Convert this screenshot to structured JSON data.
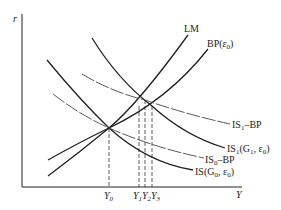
{
  "diagram": {
    "type": "IS-LM-BP macroeconomic diagram",
    "axes": {
      "y_label": "r",
      "x_label": "Y"
    },
    "curves": [
      {
        "id": "lm",
        "label": "LM",
        "style": "solid"
      },
      {
        "id": "bp",
        "label": "BP(ε0)",
        "label_main": "BP(",
        "label_sym": "ε",
        "label_sub": "0",
        "label_close": ")",
        "style": "solid"
      },
      {
        "id": "is1-bp",
        "label": "IS1–BP",
        "label_main": "IS",
        "label_sub": "1",
        "label_rest": "–BP",
        "style": "dashed"
      },
      {
        "id": "is1",
        "label": "IS1(G1, ε0)",
        "label_main": "IS",
        "label_sub": "1",
        "label_rest": "(G",
        "label_sub2": "1",
        "label_rest2": ", ε",
        "label_sub3": "0",
        "label_close": ")",
        "style": "solid"
      },
      {
        "id": "is0-bp",
        "label": "IS0–BP",
        "label_main": "IS",
        "label_sub": "0",
        "label_rest": "–BP",
        "style": "dashed"
      },
      {
        "id": "is",
        "label": "IS(G0, ε0)",
        "label_main": "IS(G",
        "label_sub": "0",
        "label_rest": ", ε",
        "label_sub2": "0",
        "label_close": ")",
        "style": "solid"
      }
    ],
    "x_ticks": [
      {
        "label": "Y",
        "sub": "0"
      },
      {
        "label": "Y",
        "sub": "1"
      },
      {
        "label": "Y",
        "sub": "2"
      },
      {
        "label": "Y",
        "sub": "3"
      }
    ]
  }
}
